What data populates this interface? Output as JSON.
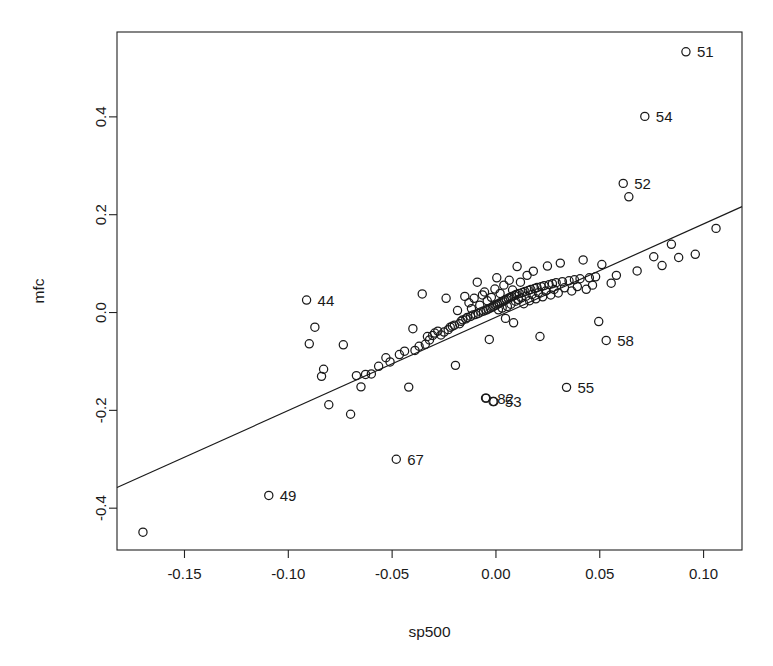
{
  "chart_data": {
    "type": "scatter",
    "title": "",
    "xlabel": "sp500",
    "ylabel": "mfc",
    "xlim": [
      -0.1825,
      0.1185
    ],
    "ylim": [
      -0.4855,
      0.5735
    ],
    "grid": false,
    "legend": "none",
    "xticks": [
      -0.15,
      -0.1,
      -0.05,
      0.0,
      0.05,
      0.1
    ],
    "xticklabels": [
      "-0.15",
      "-0.10",
      "-0.05",
      "0.00",
      "0.05",
      "0.10"
    ],
    "yticks": [
      -0.4,
      -0.2,
      0.0,
      0.2,
      0.4
    ],
    "yticklabels": [
      "-0.4",
      "-0.2",
      "0.0",
      "0.2",
      "0.4"
    ],
    "marker": "open-circle",
    "marker_size_px": 5.0,
    "fit_line": {
      "label": "regression-line",
      "x": [
        -0.1825,
        0.1185
      ],
      "y": [
        -0.3578,
        0.2165
      ],
      "slope": 1.908,
      "intercept": -0.0095
    },
    "labeled_points": [
      {
        "label": "51",
        "x": 0.0915,
        "y": 0.533
      },
      {
        "label": "54",
        "x": 0.0717,
        "y": 0.401
      },
      {
        "label": "52",
        "x": 0.0613,
        "y": 0.264
      },
      {
        "label": "44",
        "x": -0.0912,
        "y": 0.0255
      },
      {
        "label": "58",
        "x": 0.0531,
        "y": -0.057
      },
      {
        "label": "55",
        "x": 0.034,
        "y": -0.153
      },
      {
        "label": "82",
        "x": -0.0047,
        "y": -0.175
      },
      {
        "label": "53",
        "x": -0.001,
        "y": -0.182
      },
      {
        "label": "67",
        "x": -0.048,
        "y": -0.3
      },
      {
        "label": "49",
        "x": -0.1094,
        "y": -0.374
      }
    ],
    "x": [
      -0.17,
      -0.1094,
      -0.0912,
      -0.0899,
      -0.0872,
      -0.084,
      -0.083,
      -0.0805,
      -0.0735,
      -0.07,
      -0.0672,
      -0.065,
      -0.0628,
      -0.06,
      -0.0565,
      -0.053,
      -0.051,
      -0.048,
      -0.0465,
      -0.044,
      -0.042,
      -0.04,
      -0.039,
      -0.037,
      -0.0355,
      -0.034,
      -0.033,
      -0.032,
      -0.0305,
      -0.0295,
      -0.028,
      -0.0265,
      -0.025,
      -0.024,
      -0.023,
      -0.022,
      -0.021,
      -0.02,
      -0.0195,
      -0.0185,
      -0.0175,
      -0.0168,
      -0.016,
      -0.015,
      -0.0145,
      -0.0138,
      -0.013,
      -0.0122,
      -0.0118,
      -0.011,
      -0.0105,
      -0.0098,
      -0.009,
      -0.0085,
      -0.0078,
      -0.0072,
      -0.0065,
      -0.006,
      -0.0055,
      -0.005,
      -0.0047,
      -0.0042,
      -0.0038,
      -0.0032,
      -0.0028,
      -0.0022,
      -0.0018,
      -0.0014,
      -0.001,
      -0.0005,
      0.0,
      0.0004,
      0.0008,
      0.0012,
      0.0016,
      0.002,
      0.0025,
      0.003,
      0.0034,
      0.0038,
      0.0042,
      0.0046,
      0.005,
      0.0055,
      0.006,
      0.0064,
      0.0068,
      0.0072,
      0.0076,
      0.008,
      0.0085,
      0.009,
      0.0094,
      0.0098,
      0.0102,
      0.0108,
      0.0112,
      0.0118,
      0.0122,
      0.0128,
      0.0134,
      0.014,
      0.0145,
      0.015,
      0.0156,
      0.0162,
      0.0168,
      0.0174,
      0.018,
      0.0186,
      0.0192,
      0.0198,
      0.0205,
      0.0212,
      0.0218,
      0.0225,
      0.0232,
      0.024,
      0.0248,
      0.0256,
      0.0264,
      0.0272,
      0.028,
      0.029,
      0.03,
      0.031,
      0.032,
      0.033,
      0.034,
      0.0352,
      0.0365,
      0.0378,
      0.0392,
      0.0405,
      0.042,
      0.0435,
      0.045,
      0.0465,
      0.048,
      0.0495,
      0.051,
      0.0531,
      0.0555,
      0.058,
      0.0613,
      0.064,
      0.068,
      0.0717,
      0.076,
      0.08,
      0.0845,
      0.088,
      0.0915,
      0.096,
      0.106
    ],
    "y": [
      -0.449,
      -0.374,
      0.0255,
      -0.064,
      -0.03,
      -0.1305,
      -0.116,
      -0.1885,
      -0.066,
      -0.208,
      -0.129,
      -0.152,
      -0.1265,
      -0.1255,
      -0.11,
      -0.0925,
      -0.101,
      -0.3,
      -0.086,
      -0.079,
      -0.1525,
      -0.033,
      -0.0775,
      -0.069,
      0.038,
      -0.065,
      -0.049,
      -0.056,
      -0.047,
      -0.042,
      -0.038,
      -0.046,
      -0.04,
      0.029,
      -0.035,
      -0.03,
      -0.028,
      -0.026,
      -0.108,
      0.004,
      -0.023,
      -0.018,
      -0.015,
      0.033,
      -0.013,
      -0.01,
      0.02,
      -0.008,
      0.008,
      -0.005,
      0.029,
      -0.004,
      0.062,
      -0.002,
      0.015,
      0.001,
      0.036,
      0.003,
      0.042,
      -0.175,
      0.005,
      0.024,
      0.007,
      -0.055,
      0.009,
      0.031,
      0.011,
      -0.182,
      0.013,
      0.048,
      0.015,
      0.071,
      0.017,
      0.0055,
      0.019,
      0.039,
      0.021,
      0.009,
      0.023,
      0.056,
      0.025,
      -0.012,
      0.027,
      0.0125,
      0.029,
      0.066,
      0.031,
      0.017,
      0.033,
      0.046,
      -0.021,
      0.035,
      0.023,
      0.037,
      0.094,
      0.0265,
      0.039,
      0.062,
      0.03,
      0.041,
      0.018,
      0.043,
      0.0335,
      0.076,
      0.045,
      0.024,
      0.047,
      0.037,
      0.0845,
      0.049,
      0.028,
      0.051,
      0.0405,
      -0.049,
      0.053,
      0.032,
      0.055,
      0.044,
      0.095,
      0.057,
      0.036,
      0.059,
      0.047,
      0.061,
      0.04,
      0.101,
      0.063,
      0.0505,
      -0.153,
      0.065,
      0.044,
      0.067,
      0.053,
      0.069,
      0.1075,
      0.0475,
      0.071,
      0.056,
      0.073,
      -0.0185,
      0.098,
      -0.057,
      0.06,
      0.076,
      0.264,
      0.2365,
      0.085,
      0.401,
      0.114,
      0.096,
      0.1395,
      0.1125,
      0.533,
      0.119,
      0.172
    ]
  },
  "geometry": {
    "plot_left": 117,
    "plot_right": 742,
    "plot_top": 32,
    "plot_bottom": 550
  }
}
